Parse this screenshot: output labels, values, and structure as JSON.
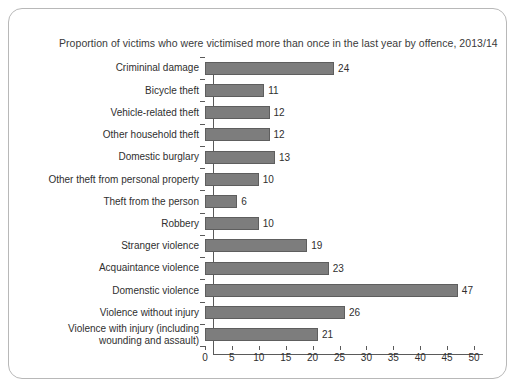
{
  "figure": {
    "title": "Proportion of victims who were victimised more than once in the last year by offence, 2013/14",
    "border_color": "#b8b8b8",
    "background": "#ffffff"
  },
  "chart_data": {
    "type": "bar",
    "orientation": "horizontal",
    "title": "Proportion of victims who were victimised more than once in the last year by offence, 2013/14",
    "xlabel": "",
    "ylabel": "",
    "xlim": [
      0,
      50
    ],
    "xticks": [
      0,
      5,
      10,
      15,
      20,
      25,
      30,
      35,
      40,
      45,
      50
    ],
    "xtick_labels": [
      "0",
      "5",
      "10",
      "15",
      "20",
      "25",
      "30",
      "35",
      "40",
      "45",
      "50"
    ],
    "grid": false,
    "legend": false,
    "bar_color": "#7d7d7d",
    "bar_edge_color": "#5e5e5e",
    "data_labels": true,
    "categories": [
      "Crimininal damage",
      "Bicycle theft",
      "Vehicle-related theft",
      "Other household theft",
      "Domestic burglary",
      "Other theft from personal property",
      "Theft from the person",
      "Robbery",
      "Stranger violence",
      "Acquaintance violence",
      "Domenstic violence",
      "Violence without injury",
      "Violence with injury (including\nwounding and assault)"
    ],
    "values": [
      24,
      11,
      12,
      12,
      13,
      10,
      6,
      10,
      19,
      23,
      47,
      26,
      21
    ],
    "value_labels": [
      "24",
      "11",
      "12",
      "12",
      "13",
      "10",
      "6",
      "10",
      "19",
      "23",
      "47",
      "26",
      "21"
    ]
  }
}
